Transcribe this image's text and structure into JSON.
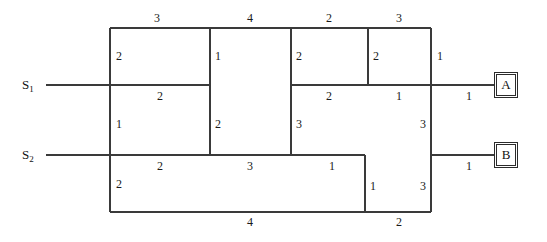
{
  "diagram": {
    "line_color": "#3a3a3a",
    "text_color": "#111111",
    "sources": [
      {
        "name": "source-s1",
        "label": "S",
        "subscript": "1",
        "x": 22,
        "y": 78
      },
      {
        "name": "source-s2",
        "label": "S",
        "subscript": "2",
        "x": 22,
        "y": 148
      }
    ],
    "terminals": [
      {
        "name": "terminal-a",
        "label": "A",
        "x": 494,
        "y": 72,
        "w": 24,
        "h": 26
      },
      {
        "name": "terminal-b",
        "label": "B",
        "x": 494,
        "y": 142,
        "w": 24,
        "h": 26
      }
    ],
    "edge_labels": [
      {
        "id": "top-1",
        "value": "3",
        "x": 154,
        "y": 12
      },
      {
        "id": "top-2",
        "value": "4",
        "x": 247,
        "y": 12
      },
      {
        "id": "top-3",
        "value": "2",
        "x": 326,
        "y": 12
      },
      {
        "id": "top-4",
        "value": "3",
        "x": 396,
        "y": 12
      },
      {
        "id": "left-upper",
        "value": "2",
        "x": 116,
        "y": 50
      },
      {
        "id": "mid1-upper",
        "value": "1",
        "x": 215,
        "y": 50
      },
      {
        "id": "mid2-upper",
        "value": "2",
        "x": 296,
        "y": 50
      },
      {
        "id": "mid3-upper",
        "value": "2",
        "x": 373,
        "y": 50
      },
      {
        "id": "right-upper",
        "value": "1",
        "x": 437,
        "y": 50
      },
      {
        "id": "s1-row-1",
        "value": "2",
        "x": 157,
        "y": 90
      },
      {
        "id": "s1-row-2",
        "value": "2",
        "x": 326,
        "y": 90
      },
      {
        "id": "s1-row-3",
        "value": "1",
        "x": 396,
        "y": 90
      },
      {
        "id": "s1-lead",
        "value": "1",
        "x": 466,
        "y": 90
      },
      {
        "id": "left-mid",
        "value": "1",
        "x": 116,
        "y": 118
      },
      {
        "id": "mid1-lower",
        "value": "2",
        "x": 215,
        "y": 118
      },
      {
        "id": "mid2-lower",
        "value": "3",
        "x": 296,
        "y": 118
      },
      {
        "id": "right-mid",
        "value": "3",
        "x": 420,
        "y": 118
      },
      {
        "id": "s2-row-1",
        "value": "2",
        "x": 157,
        "y": 160
      },
      {
        "id": "s2-row-2",
        "value": "3",
        "x": 247,
        "y": 160
      },
      {
        "id": "s2-row-3",
        "value": "1",
        "x": 329,
        "y": 160
      },
      {
        "id": "s2-lead",
        "value": "1",
        "x": 466,
        "y": 160
      },
      {
        "id": "left-lower",
        "value": "2",
        "x": 116,
        "y": 178
      },
      {
        "id": "step-vert",
        "value": "1",
        "x": 370,
        "y": 180
      },
      {
        "id": "right-lower",
        "value": "3",
        "x": 420,
        "y": 180
      },
      {
        "id": "bottom-1",
        "value": "4",
        "x": 247,
        "y": 216
      },
      {
        "id": "bottom-2",
        "value": "2",
        "x": 396,
        "y": 216
      }
    ]
  }
}
